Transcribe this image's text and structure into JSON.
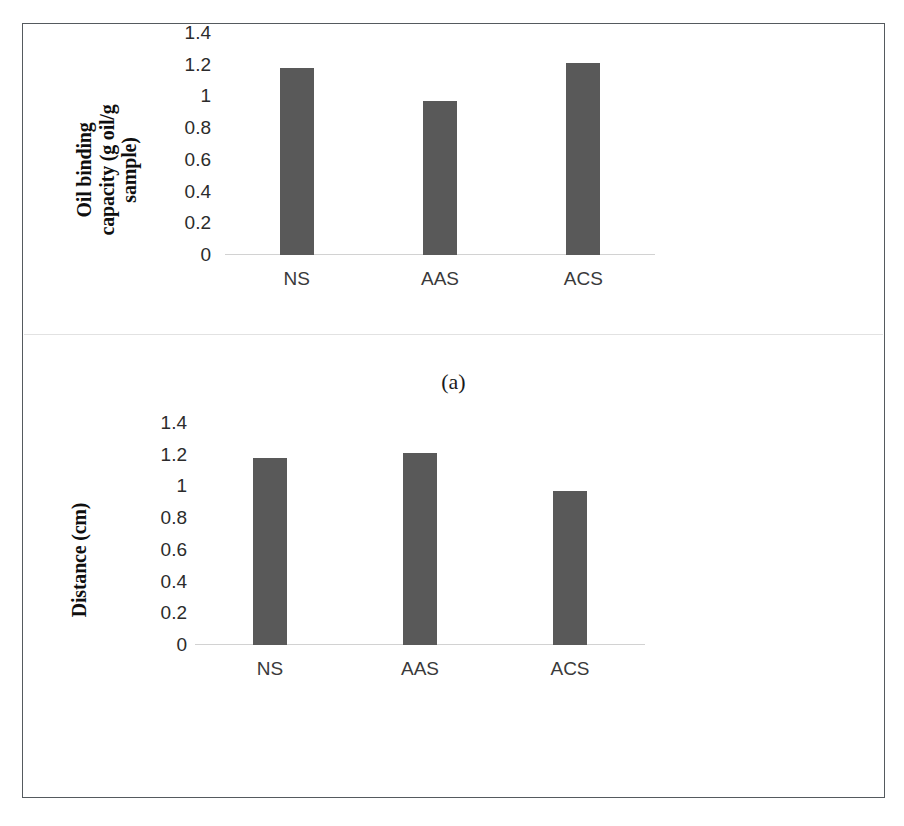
{
  "figure": {
    "border_color": "#555a5e",
    "background": "#ffffff"
  },
  "panels": [
    {
      "caption": "(a)",
      "ylabel": "Oil binding capacity (g oil/g sample)",
      "ylabel_line1": "Oil binding",
      "ylabel_line2": "capacity (g oil/g",
      "ylabel_line3": "sample)"
    },
    {
      "caption": "(b)",
      "ylabel": "Distance (cm)",
      "ylabel_line1": "Distance (cm)"
    }
  ],
  "ticks": [
    "1.4",
    "1.2",
    "1",
    "0.8",
    "0.6",
    "0.4",
    "0.2",
    "0"
  ],
  "categories": [
    "NS",
    "AAS",
    "ACS"
  ],
  "colors": {
    "bar": "#595959",
    "baseline": "#d2d2d2",
    "tick_text": "#2b2b2b",
    "category_text": "#3a3a3a"
  },
  "chart_data": [
    {
      "type": "bar",
      "title": "(a)",
      "categories": [
        "NS",
        "AAS",
        "ACS"
      ],
      "values": [
        1.18,
        0.97,
        1.21
      ],
      "xlabel": "",
      "ylabel": "Oil binding capacity (g oil/g sample)",
      "ylim": [
        0,
        1.4
      ],
      "ytick_labels": [
        "0",
        "0.2",
        "0.4",
        "0.6",
        "0.8",
        "1",
        "1.2",
        "1.4"
      ],
      "ytick_values": [
        0,
        0.2,
        0.4,
        0.6,
        0.8,
        1,
        1.2,
        1.4
      ],
      "grid": false,
      "legend": false,
      "bar_color": "#595959"
    },
    {
      "type": "bar",
      "title": "(b)",
      "categories": [
        "NS",
        "AAS",
        "ACS"
      ],
      "values": [
        1.18,
        1.21,
        0.97
      ],
      "xlabel": "",
      "ylabel": "Distance (cm)",
      "ylim": [
        0,
        1.4
      ],
      "ytick_labels": [
        "0",
        "0.2",
        "0.4",
        "0.6",
        "0.8",
        "1",
        "1.2",
        "1.4"
      ],
      "ytick_values": [
        0,
        0.2,
        0.4,
        0.6,
        0.8,
        1,
        1.2,
        1.4
      ],
      "grid": false,
      "legend": false,
      "bar_color": "#595959"
    }
  ]
}
